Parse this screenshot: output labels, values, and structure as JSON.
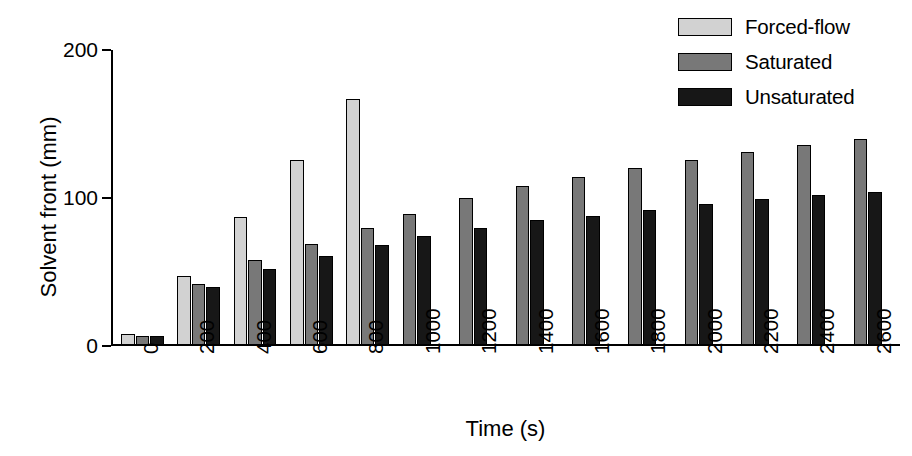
{
  "chart_data": {
    "type": "bar",
    "title": "",
    "xlabel": "Time (s)",
    "ylabel": "Solvent front (mm)",
    "ylim": [
      0,
      200
    ],
    "yticks": [
      0,
      100,
      200
    ],
    "ytick_labels": [
      "0",
      "100",
      "200"
    ],
    "grid": false,
    "legend_position": "top-right",
    "categories": [
      "0",
      "200",
      "400",
      "600",
      "800",
      "1000",
      "1200",
      "1400",
      "1600",
      "1800",
      "2000",
      "2200",
      "2400",
      "2600"
    ],
    "x": [
      0,
      200,
      400,
      600,
      800,
      1000,
      1200,
      1400,
      1600,
      1800,
      2000,
      2200,
      2400,
      2600
    ],
    "series": [
      {
        "name": "Forced-flow",
        "color": "#d2d2d2",
        "values": [
          8,
          47,
          87,
          126,
          167,
          null,
          null,
          null,
          null,
          null,
          null,
          null,
          null,
          null
        ]
      },
      {
        "name": "Saturated",
        "color": "#787878",
        "values": [
          7,
          42,
          58,
          69,
          80,
          89,
          100,
          108,
          114,
          120,
          126,
          131,
          136,
          140
        ]
      },
      {
        "name": "Unsaturated",
        "color": "#171717",
        "values": [
          7,
          40,
          52,
          61,
          68,
          74,
          80,
          85,
          88,
          92,
          96,
          99,
          102,
          104
        ]
      }
    ]
  },
  "legend": {
    "entries": [
      {
        "label": "Forced-flow",
        "color": "#d2d2d2"
      },
      {
        "label": "Saturated",
        "color": "#787878"
      },
      {
        "label": "Unsaturated",
        "color": "#171717"
      }
    ]
  },
  "axes": {
    "y_title": "Solvent front (mm)",
    "x_title": "Time (s)"
  }
}
